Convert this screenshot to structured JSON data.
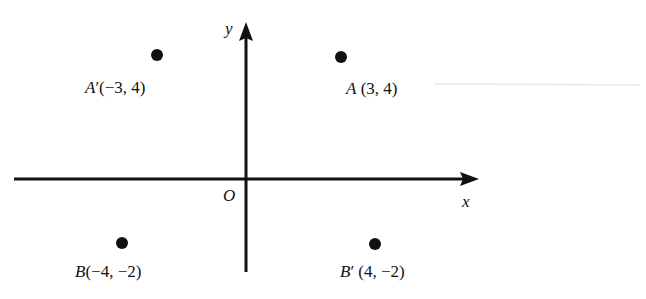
{
  "diagram": {
    "type": "coordinate-plane",
    "axes": {
      "x_label": "x",
      "y_label": "y",
      "origin_label": "O"
    },
    "points": [
      {
        "name": "A'",
        "letter": "A",
        "prime": "′",
        "coords": "(−3, 4)",
        "x": -3,
        "y": 4
      },
      {
        "name": "A",
        "letter": "A",
        "prime": "",
        "coords": "(3, 4)",
        "x": 3,
        "y": 4
      },
      {
        "name": "B",
        "letter": "B",
        "prime": "",
        "coords": "(−4, −2)",
        "x": -4,
        "y": -2
      },
      {
        "name": "B'",
        "letter": "B",
        "prime": "′",
        "coords": "(4, −2)",
        "x": 4,
        "y": -2
      }
    ],
    "colors": {
      "ink": "#111111",
      "background": "#ffffff"
    }
  }
}
